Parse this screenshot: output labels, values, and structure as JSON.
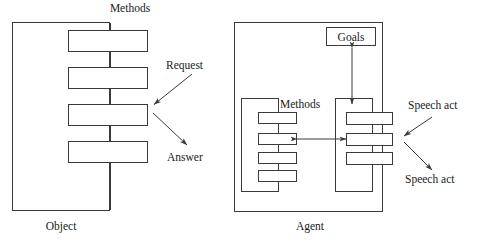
{
  "figure": {
    "type": "diagram",
    "background_color": "#ffffff",
    "stroke_color": "#3a3a3a",
    "fill_color": "#ffffff",
    "text_color": "#1a1a1a"
  },
  "left_panel": {
    "name": "object-panel",
    "caption": "Object",
    "methods_label": "Methods",
    "container": {
      "x": 12,
      "y": 22,
      "w": 98,
      "h": 189
    },
    "method_boxes": [
      {
        "index": 1,
        "x": 68,
        "y": 30,
        "w": 80,
        "h": 22
      },
      {
        "index": 2,
        "x": 68,
        "y": 67,
        "w": 80,
        "h": 22
      },
      {
        "index": 3,
        "x": 68,
        "y": 104,
        "w": 80,
        "h": 22
      },
      {
        "index": 4,
        "x": 68,
        "y": 141,
        "w": 80,
        "h": 22
      }
    ],
    "spine_x": 110,
    "annotations": [
      {
        "name": "request",
        "label": "Request",
        "label_x": 196,
        "label_y": 66,
        "arrow_from": [
          192,
          74
        ],
        "arrow_to": [
          153,
          105
        ]
      },
      {
        "name": "answer",
        "label": "Answer",
        "label_x": 196,
        "label_y": 158,
        "arrow_from": [
          153,
          113
        ],
        "arrow_to": [
          188,
          146
        ]
      }
    ]
  },
  "right_panel": {
    "name": "agent-panel",
    "caption": "Agent",
    "methods_label": "Methods",
    "goals_label": "Goals",
    "container": {
      "x": 234,
      "y": 22,
      "w": 149,
      "h": 190
    },
    "goals_box": {
      "x": 326,
      "y": 27,
      "w": 50,
      "h": 19
    },
    "methods_group": {
      "container": {
        "x": 241,
        "y": 98,
        "w": 38,
        "h": 94
      },
      "boxes": [
        {
          "index": 1,
          "x": 258,
          "y": 112,
          "w": 39,
          "h": 12
        },
        {
          "index": 2,
          "x": 258,
          "y": 133,
          "w": 39,
          "h": 12
        },
        {
          "index": 3,
          "x": 258,
          "y": 152,
          "w": 39,
          "h": 12
        },
        {
          "index": 4,
          "x": 258,
          "y": 170,
          "w": 39,
          "h": 12
        }
      ]
    },
    "actions_group": {
      "container": {
        "x": 335,
        "y": 98,
        "w": 38,
        "h": 94
      },
      "boxes": [
        {
          "index": 1,
          "x": 346,
          "y": 112,
          "w": 47,
          "h": 13
        },
        {
          "index": 2,
          "x": 346,
          "y": 133,
          "w": 47,
          "h": 13
        },
        {
          "index": 3,
          "x": 346,
          "y": 152,
          "w": 47,
          "h": 13
        }
      ]
    },
    "connectors": {
      "goals_vertical": {
        "x": 352,
        "y_top": 46,
        "y_bottom": 105,
        "heads": "both"
      },
      "groups_horizontal": {
        "y": 139,
        "x_left": 296,
        "x_right": 347,
        "heads": "both"
      }
    },
    "annotations": [
      {
        "name": "speech-act-in",
        "label": "Speech act",
        "label_x": 438,
        "label_y": 106,
        "arrow_from": [
          432,
          116
        ],
        "arrow_to": [
          403,
          137
        ]
      },
      {
        "name": "speech-act-out",
        "label": "Speech act",
        "label_x": 438,
        "label_y": 180,
        "arrow_from": [
          403,
          142
        ],
        "arrow_to": [
          433,
          171
        ]
      }
    ]
  }
}
